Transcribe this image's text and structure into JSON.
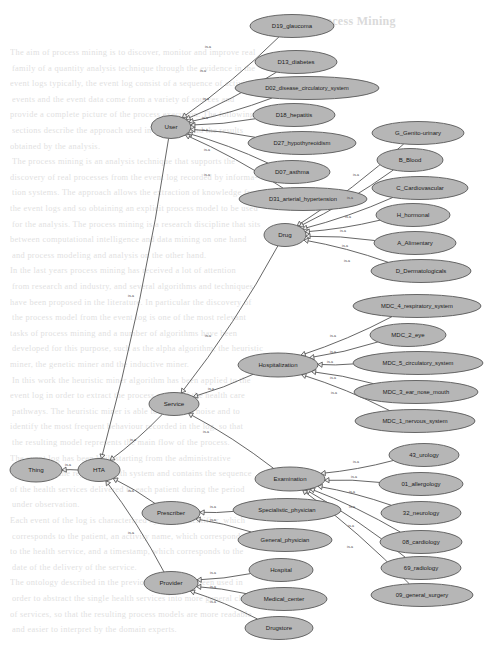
{
  "page": {
    "background_color": "#ffffff",
    "node_fill": "#b6b6b6",
    "node_stroke": "#595959",
    "edge_color": "#4a4a4a",
    "arrowhead_fill": "#efefef",
    "relation_label": "is-a"
  },
  "bleed_text": {
    "heading": "4. Process Mining",
    "lines": [
      "The aim of process mining is to discover, monitor and improve real",
      "family of a quantity analysis technique through the evidence in the",
      "event logs typically, the event log consist of a sequence of activities",
      "events and the event data come from a variety of sources and",
      "provide a complete picture of the process execution. The following",
      "sections describe the approach used in this work and the results",
      "obtained by the analysis.",
      "The process mining is an analysis technique that supports the",
      "discovery of real processes from the event log recorded by informa-",
      "tion systems. The approach allows the extraction of knowledge from",
      "the event logs and so obtaining an explicit process model to be used",
      "for the analysis. The process mining is a research discipline that sits",
      "between computational intelligence and data mining on one hand",
      "and process modeling and analysis on the other hand.",
      "In the last years process mining has received a lot of attention",
      "from research and industry, and several algorithms and techniques",
      "have been proposed in the literature. In particular the discovery of",
      "the process model from the event log is one of the most relevant",
      "tasks of process mining and a number of algorithms have been",
      "developed for this purpose, such as the alpha algorithm, the heuristic",
      "miner, the genetic miner and the inductive miner.",
      "In this work the heuristic miner algorithm has been applied to the",
      "event log in order to extract the process model of the health care",
      "pathways. The heuristic miner is able to deal with noise and to",
      "identify the most frequent behaviour recorded in the log, so that",
      "the resulting model represents the main flow of the process.",
      "The event log has been built starting from the administrative",
      "databases of the regional health system and contains the sequence",
      "of the health services delivered to each patient during the period",
      "under observation.",
      "Each event of the log is characterized by a case identifier, which",
      "corresponds to the patient, an activity name, which corresponds",
      "to the health service, and a timestamp, which corresponds to the",
      "date of the delivery of the service.",
      "The ontology described in the previous section has been used in",
      "order to abstract the single health services into more general classes",
      "of services, so that the resulting process models are more readable",
      "and easier to interpret by the domain experts."
    ]
  },
  "graph": {
    "type": "is-a-taxonomy",
    "root": "Thing",
    "nodes": [
      {
        "id": "thing",
        "label": "Thing",
        "x": 36,
        "y": 470,
        "rx": 26,
        "ry": 12,
        "font": 6.2
      },
      {
        "id": "hta",
        "label": "HTA",
        "x": 99,
        "y": 470,
        "rx": 21,
        "ry": 11.5,
        "font": 6.2
      },
      {
        "id": "user",
        "label": "User",
        "x": 171,
        "y": 127,
        "rx": 20,
        "ry": 11.5,
        "font": 6.2
      },
      {
        "id": "drug",
        "label": "Drug",
        "x": 285,
        "y": 235,
        "rx": 21,
        "ry": 11.5,
        "font": 6.2
      },
      {
        "id": "service",
        "label": "Service",
        "x": 174,
        "y": 404,
        "rx": 25,
        "ry": 11.5,
        "font": 6.2
      },
      {
        "id": "hospitaliz",
        "label": "Hospitalization",
        "x": 278,
        "y": 365,
        "rx": 40,
        "ry": 12,
        "font": 6.0
      },
      {
        "id": "examinat",
        "label": "Examination",
        "x": 290,
        "y": 479,
        "rx": 35,
        "ry": 12,
        "font": 6.0
      },
      {
        "id": "prescriber",
        "label": "Prescriber",
        "x": 171,
        "y": 513,
        "rx": 29,
        "ry": 11.5,
        "font": 6.2
      },
      {
        "id": "provider",
        "label": "Provider",
        "x": 171,
        "y": 583,
        "rx": 27,
        "ry": 11.5,
        "font": 6.2
      },
      {
        "id": "d19",
        "label": "D19_glaucoma",
        "x": 292,
        "y": 26,
        "rx": 42,
        "ry": 11.5,
        "font": 6.0
      },
      {
        "id": "d13",
        "label": "D13_diabetes",
        "x": 296,
        "y": 62,
        "rx": 41,
        "ry": 11.5,
        "font": 6.0
      },
      {
        "id": "d02",
        "label": "D02_disease_circulatory_system",
        "x": 307,
        "y": 88,
        "rx": 72,
        "ry": 11.5,
        "font": 5.7
      },
      {
        "id": "d18",
        "label": "D18_hepatitis",
        "x": 294,
        "y": 115,
        "rx": 41,
        "ry": 11.5,
        "font": 6.0
      },
      {
        "id": "d27",
        "label": "D27_hypothyreoidism",
        "x": 302,
        "y": 143,
        "rx": 54,
        "ry": 11.5,
        "font": 5.9
      },
      {
        "id": "d07",
        "label": "D07_asthma",
        "x": 292,
        "y": 172,
        "rx": 38,
        "ry": 11.5,
        "font": 6.0
      },
      {
        "id": "d31",
        "label": "D31_arterial_hypertension",
        "x": 303,
        "y": 199,
        "rx": 64,
        "ry": 11.5,
        "font": 5.8
      },
      {
        "id": "g_gen",
        "label": "G_Genito-urinary",
        "x": 418,
        "y": 133,
        "rx": 46,
        "ry": 11.5,
        "font": 6.0
      },
      {
        "id": "b_blo",
        "label": "B_Blood",
        "x": 410,
        "y": 160,
        "rx": 33,
        "ry": 11.5,
        "font": 6.0
      },
      {
        "id": "c_car",
        "label": "C_Cardiovascular",
        "x": 420,
        "y": 188,
        "rx": 48,
        "ry": 11.5,
        "font": 6.0
      },
      {
        "id": "h_hor",
        "label": "H_hormonal",
        "x": 413,
        "y": 215,
        "rx": 37,
        "ry": 11.5,
        "font": 6.0
      },
      {
        "id": "a_ali",
        "label": "A_Alimentary",
        "x": 415,
        "y": 243,
        "rx": 41,
        "ry": 11.5,
        "font": 6.0
      },
      {
        "id": "d_der",
        "label": "D_Dermatologicals",
        "x": 421,
        "y": 271,
        "rx": 50,
        "ry": 11.5,
        "font": 6.0
      },
      {
        "id": "mdc4",
        "label": "MDC_4_respiratory_system",
        "x": 417,
        "y": 306,
        "rx": 64,
        "ry": 11.5,
        "font": 5.8
      },
      {
        "id": "mdc2",
        "label": "MDC_2_eye",
        "x": 408,
        "y": 335,
        "rx": 38,
        "ry": 11.5,
        "font": 6.0
      },
      {
        "id": "mdc5",
        "label": "MDC_5_circulatory_system",
        "x": 418,
        "y": 363,
        "rx": 65,
        "ry": 11.5,
        "font": 5.8
      },
      {
        "id": "mdc3",
        "label": "MDC_3_ear_nose_mouth",
        "x": 416,
        "y": 392,
        "rx": 62,
        "ry": 11.5,
        "font": 5.8
      },
      {
        "id": "mdc1",
        "label": "MDC_1_nervous_system",
        "x": 415,
        "y": 421,
        "rx": 60,
        "ry": 11.5,
        "font": 5.8
      },
      {
        "id": "e43",
        "label": "43_urology",
        "x": 424,
        "y": 455,
        "rx": 35,
        "ry": 11.5,
        "font": 6.0
      },
      {
        "id": "e01",
        "label": "01_allergology",
        "x": 421,
        "y": 484,
        "rx": 42,
        "ry": 11.5,
        "font": 6.0
      },
      {
        "id": "e32",
        "label": "32_neurology",
        "x": 421,
        "y": 513,
        "rx": 40,
        "ry": 11.5,
        "font": 6.0
      },
      {
        "id": "e08",
        "label": "08_cardiology",
        "x": 421,
        "y": 542,
        "rx": 41,
        "ry": 11.5,
        "font": 6.0
      },
      {
        "id": "e69",
        "label": "69_radiology",
        "x": 421,
        "y": 568,
        "rx": 40,
        "ry": 11.5,
        "font": 6.0
      },
      {
        "id": "e09",
        "label": "09_general_surgery",
        "x": 422,
        "y": 595,
        "rx": 51,
        "ry": 11.5,
        "font": 5.9
      },
      {
        "id": "spec",
        "label": "Specialistic_physician",
        "x": 287,
        "y": 510,
        "rx": 54,
        "ry": 11.5,
        "font": 5.9
      },
      {
        "id": "genp",
        "label": "General_physician",
        "x": 285,
        "y": 540,
        "rx": 47,
        "ry": 11.5,
        "font": 5.9
      },
      {
        "id": "hosp",
        "label": "Hospital",
        "x": 281,
        "y": 570,
        "rx": 32,
        "ry": 11.5,
        "font": 6.0
      },
      {
        "id": "medc",
        "label": "Medical_center",
        "x": 284,
        "y": 599,
        "rx": 43,
        "ry": 11.5,
        "font": 6.0
      },
      {
        "id": "drst",
        "label": "Drugstore",
        "x": 279,
        "y": 628,
        "rx": 34,
        "ry": 11.5,
        "font": 6.0
      }
    ],
    "edges": [
      {
        "from": "hta",
        "to": "thing",
        "label": "is-a",
        "lx": 68,
        "ly": 466
      },
      {
        "from": "user",
        "to": "hta",
        "label": "is-a",
        "lx": 131,
        "ly": 297
      },
      {
        "from": "service",
        "to": "hta",
        "label": "is-a",
        "lx": 133,
        "ly": 441
      },
      {
        "from": "prescriber",
        "to": "hta",
        "label": "is-a",
        "lx": 131,
        "ly": 492
      },
      {
        "from": "provider",
        "to": "hta",
        "label": "is-a",
        "lx": 131,
        "ly": 534
      },
      {
        "from": "d19",
        "to": "user",
        "label": "is-a",
        "lx": 208,
        "ly": 48
      },
      {
        "from": "d13",
        "to": "user",
        "label": "is-a",
        "lx": 203,
        "ly": 72
      },
      {
        "from": "d02",
        "to": "user",
        "label": "is-a",
        "lx": 206,
        "ly": 100
      },
      {
        "from": "d18",
        "to": "user",
        "label": "is-a",
        "lx": 205,
        "ly": 119
      },
      {
        "from": "d27",
        "to": "user",
        "label": "is-a",
        "lx": 205,
        "ly": 131
      },
      {
        "from": "d07",
        "to": "user",
        "label": "is-a",
        "lx": 207,
        "ly": 151
      },
      {
        "from": "d31",
        "to": "user",
        "label": "is-a",
        "lx": 207,
        "ly": 176
      },
      {
        "from": "g_gen",
        "to": "drug",
        "label": "is-a",
        "lx": 356,
        "ly": 176
      },
      {
        "from": "b_blo",
        "to": "drug",
        "label": "is-a",
        "lx": 350,
        "ly": 199
      },
      {
        "from": "c_car",
        "to": "drug",
        "label": "is-a",
        "lx": 348,
        "ly": 218
      },
      {
        "from": "h_hor",
        "to": "drug",
        "label": "is-a",
        "lx": 343,
        "ly": 232
      },
      {
        "from": "a_ali",
        "to": "drug",
        "label": "is-a",
        "lx": 345,
        "ly": 247
      },
      {
        "from": "d_der",
        "to": "drug",
        "label": "is-a",
        "lx": 347,
        "ly": 262
      },
      {
        "from": "drug",
        "to": "service",
        "label": "is-a",
        "lx": 208,
        "ly": 337
      },
      {
        "from": "hospitaliz",
        "to": "service",
        "label": "is-a",
        "lx": 211,
        "ly": 390
      },
      {
        "from": "examinat",
        "to": "service",
        "label": "is-a",
        "lx": 206,
        "ly": 433
      },
      {
        "from": "mdc4",
        "to": "hospitaliz",
        "label": "is-a",
        "lx": 333,
        "ly": 337
      },
      {
        "from": "mdc2",
        "to": "hospitaliz",
        "label": "is-a",
        "lx": 333,
        "ly": 353
      },
      {
        "from": "mdc5",
        "to": "hospitaliz",
        "label": "is-a",
        "lx": 330,
        "ly": 363
      },
      {
        "from": "mdc3",
        "to": "hospitaliz",
        "label": "is-a",
        "lx": 333,
        "ly": 379
      },
      {
        "from": "mdc1",
        "to": "hospitaliz",
        "label": "is-a",
        "lx": 334,
        "ly": 394
      },
      {
        "from": "e43",
        "to": "examinat",
        "label": "is-a",
        "lx": 356,
        "ly": 463
      },
      {
        "from": "e01",
        "to": "examinat",
        "label": "is-a",
        "lx": 354,
        "ly": 478
      },
      {
        "from": "e32",
        "to": "examinat",
        "label": "is-a",
        "lx": 352,
        "ly": 493
      },
      {
        "from": "e08",
        "to": "examinat",
        "label": "is-a",
        "lx": 352,
        "ly": 508
      },
      {
        "from": "e69",
        "to": "examinat",
        "label": "is-a",
        "lx": 351,
        "ly": 527
      },
      {
        "from": "e09",
        "to": "examinat",
        "label": "is-a",
        "lx": 350,
        "ly": 548
      },
      {
        "from": "spec",
        "to": "prescriber",
        "label": "is-a",
        "lx": 213,
        "ly": 508
      },
      {
        "from": "genp",
        "to": "prescriber",
        "label": "is-a",
        "lx": 213,
        "ly": 521
      },
      {
        "from": "hosp",
        "to": "provider",
        "label": "is-a",
        "lx": 213,
        "ly": 574
      },
      {
        "from": "medc",
        "to": "provider",
        "label": "is-a",
        "lx": 213,
        "ly": 588
      },
      {
        "from": "drst",
        "to": "provider",
        "label": "is-a",
        "lx": 213,
        "ly": 603
      }
    ]
  }
}
